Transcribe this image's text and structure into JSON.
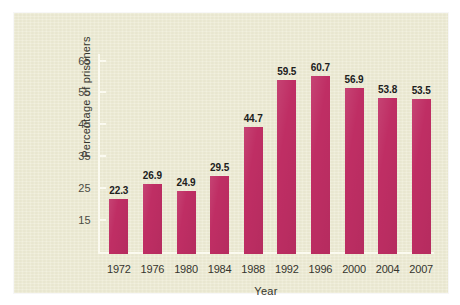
{
  "figure": {
    "panel_background": "#edebd4",
    "page_background": "#ffffff",
    "bar_color": "#bf2e64",
    "axis_color": "#fbfaf0",
    "text_color": "#35352e"
  },
  "chart_data": {
    "type": "bar",
    "title": "",
    "xlabel": "Year",
    "ylabel": "Percentage of prisoners",
    "categories": [
      "1972",
      "1976",
      "1980",
      "1984",
      "1988",
      "1992",
      "1996",
      "2000",
      "2004",
      "2007"
    ],
    "values": [
      22.3,
      26.9,
      24.9,
      29.5,
      44.7,
      59.5,
      60.7,
      56.9,
      53.8,
      53.5
    ],
    "value_labels": [
      "22.3",
      "26.9",
      "24.9",
      "29.5",
      "44.7",
      "59.5",
      "60.7",
      "56.9",
      "53.8",
      "53.5"
    ],
    "yticks": [
      65,
      55,
      45,
      35,
      25,
      15
    ],
    "ytick_labels": [
      "65",
      "55",
      "45",
      "35",
      "25",
      "15"
    ],
    "ylim": [
      5,
      68
    ],
    "grid": false,
    "legend": null,
    "legend_position": "none"
  }
}
